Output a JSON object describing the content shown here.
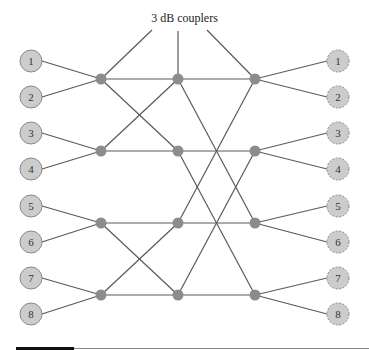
{
  "figure": {
    "caption": "3 dB couplers",
    "colors": {
      "line": "#5a5a5a",
      "node_fill": "#cccccc",
      "node_stroke": "#8a8a8a",
      "coupler_fill": "#8c8c8c"
    },
    "input_ports": [
      {
        "label": "1",
        "x": 31,
        "y": 61
      },
      {
        "label": "2",
        "x": 31,
        "y": 97
      },
      {
        "label": "3",
        "x": 31,
        "y": 133
      },
      {
        "label": "4",
        "x": 31,
        "y": 169
      },
      {
        "label": "5",
        "x": 31,
        "y": 206
      },
      {
        "label": "6",
        "x": 31,
        "y": 242
      },
      {
        "label": "7",
        "x": 31,
        "y": 278
      },
      {
        "label": "8",
        "x": 31,
        "y": 314
      }
    ],
    "output_ports": [
      {
        "label": "1",
        "x": 338,
        "y": 61
      },
      {
        "label": "2",
        "x": 338,
        "y": 97
      },
      {
        "label": "3",
        "x": 338,
        "y": 133
      },
      {
        "label": "4",
        "x": 338,
        "y": 169
      },
      {
        "label": "5",
        "x": 338,
        "y": 206
      },
      {
        "label": "6",
        "x": 338,
        "y": 242
      },
      {
        "label": "7",
        "x": 338,
        "y": 278
      },
      {
        "label": "8",
        "x": 338,
        "y": 314
      }
    ],
    "coupler_columns_x": [
      101,
      178,
      255
    ],
    "coupler_rows_y": [
      79,
      151,
      223,
      295
    ],
    "stage1_links": [
      [
        0,
        0
      ],
      [
        0,
        1
      ],
      [
        1,
        1
      ],
      [
        1,
        0
      ],
      [
        2,
        2
      ],
      [
        2,
        3
      ],
      [
        3,
        3
      ],
      [
        3,
        2
      ]
    ],
    "stage2_links": [
      [
        0,
        0
      ],
      [
        0,
        2
      ],
      [
        1,
        1
      ],
      [
        1,
        3
      ],
      [
        2,
        2
      ],
      [
        2,
        0
      ],
      [
        3,
        3
      ],
      [
        3,
        1
      ]
    ],
    "caption_pointers": [
      {
        "x1": 152,
        "y1": 30,
        "x2": 101,
        "y2": 79
      },
      {
        "x1": 178,
        "y1": 31,
        "x2": 178,
        "y2": 79
      },
      {
        "x1": 207,
        "y1": 30,
        "x2": 255,
        "y2": 79
      }
    ]
  }
}
